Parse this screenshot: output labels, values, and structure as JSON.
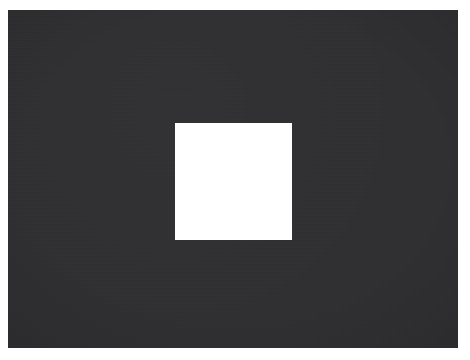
{
  "scene": {
    "title": "Dark field with centered white square",
    "description": "A full-bleed dark charcoal rectangle occupying nearly the entire frame, bordered by a thin white page margin, containing a single solid white square patch slightly left of center.",
    "canvas": {
      "width_px": 470,
      "height_px": 360,
      "background_color": "#ffffff"
    },
    "dark_field": {
      "label": "dark background field",
      "color": "#2f2f31",
      "x_px": 8,
      "y_px": 10,
      "width_px": 450,
      "height_px": 338,
      "texture": "fine uniform grain",
      "has_border": false
    },
    "white_square": {
      "label": "white square patch",
      "color": "#ffffff",
      "x_px": 175,
      "y_px": 123,
      "width_px": 117,
      "height_px": 117,
      "edge": "hard, anti-aliased, no outline",
      "center_x_px": 233,
      "center_y_px": 181
    },
    "margins": {
      "left_px": 8,
      "top_px": 10,
      "right_px": 12,
      "bottom_px": 12,
      "color": "#ffffff"
    }
  }
}
